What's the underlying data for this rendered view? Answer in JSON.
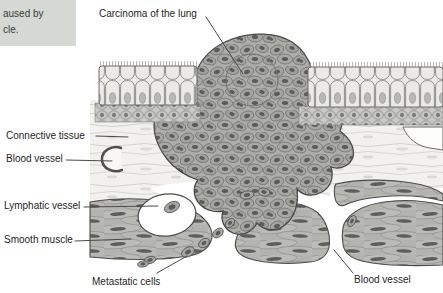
{
  "caption_box": {
    "text_line1": "aused by",
    "text_line2": "cle."
  },
  "figure": {
    "labels": {
      "carcinoma": "Carcinoma of the lung",
      "connective_tissue": "Connective tissue",
      "blood_vessel_left": "Blood vessel",
      "lymphatic_vessel": "Lymphatic vessel",
      "smooth_muscle": "Smooth muscle",
      "metastatic_cells": "Metastatic cells",
      "blood_vessel_right": "Blood vessel"
    }
  },
  "colors": {
    "caption_bg": "#d6d9d3",
    "label_text": "#262626",
    "pointer_line": "#4a4a4a",
    "tumor_cell": "#a4a4a1",
    "tumor_nucleus": "#5b5b58",
    "epithelium_cell": "#edebe7",
    "connective_tissue": "#f2f1ee",
    "smooth_muscle": "#b3b3b0",
    "outline": "#4c4c49",
    "lumen": "#ffffff"
  }
}
